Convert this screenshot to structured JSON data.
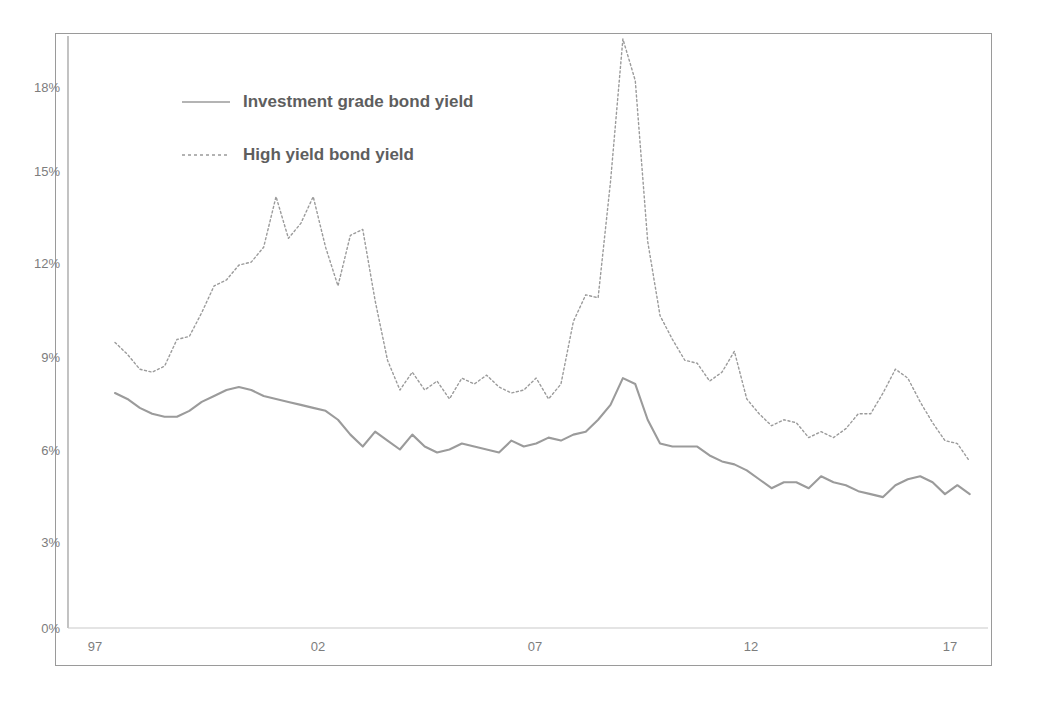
{
  "chart_data": {
    "type": "line",
    "title": "",
    "subtitle": "",
    "xlabel": "",
    "ylabel": "",
    "xlim": [
      1997.0,
      2017.9
    ],
    "ylim": [
      0,
      19.9
    ],
    "grid": false,
    "legend_position": "top-left-inside",
    "y_ticks": [
      "0%",
      "3%",
      "6%",
      "9%",
      "12%",
      "15%",
      "18%"
    ],
    "y_tick_values": [
      0,
      3,
      6,
      9,
      12,
      15,
      18
    ],
    "x_ticks": [
      "97",
      "02",
      "07",
      "12",
      "17"
    ],
    "x_tick_values": [
      1997,
      2002,
      2007,
      2012,
      2017
    ],
    "series": [
      {
        "name": "Investment grade bond yield",
        "style": "solid",
        "color": "#9b9b9b",
        "x": [
          1997.0,
          1997.3,
          1997.6,
          1997.9,
          1998.2,
          1998.5,
          1998.8,
          1999.1,
          1999.4,
          1999.7,
          2000.0,
          2000.3,
          2000.6,
          2000.9,
          2001.2,
          2001.5,
          2001.8,
          2002.1,
          2002.4,
          2002.7,
          2003.0,
          2003.3,
          2003.6,
          2003.9,
          2004.2,
          2004.5,
          2004.8,
          2005.1,
          2005.4,
          2005.7,
          2006.0,
          2006.3,
          2006.6,
          2006.9,
          2007.2,
          2007.5,
          2007.8,
          2008.1,
          2008.4,
          2008.7,
          2009.0,
          2009.3,
          2009.6,
          2009.9,
          2010.2,
          2010.5,
          2010.8,
          2011.1,
          2011.4,
          2011.7,
          2012.0,
          2012.3,
          2012.6,
          2012.9,
          2013.2,
          2013.5,
          2013.8,
          2014.1,
          2014.4,
          2014.7,
          2015.0,
          2015.3,
          2015.6,
          2015.9,
          2016.2,
          2016.5,
          2016.8,
          2017.1,
          2017.4,
          2017.7
        ],
        "y": [
          7.9,
          7.7,
          7.4,
          7.2,
          7.1,
          7.1,
          7.3,
          7.6,
          7.8,
          8.0,
          8.1,
          8.0,
          7.8,
          7.7,
          7.6,
          7.5,
          7.4,
          7.3,
          7.0,
          6.5,
          6.1,
          6.6,
          6.3,
          6.0,
          6.5,
          6.1,
          5.9,
          6.0,
          6.2,
          6.1,
          6.0,
          5.9,
          6.3,
          6.1,
          6.2,
          6.4,
          6.3,
          6.5,
          6.6,
          7.0,
          7.5,
          8.4,
          8.2,
          7.0,
          6.2,
          6.1,
          6.1,
          6.1,
          5.8,
          5.6,
          5.5,
          5.3,
          5.0,
          4.7,
          4.9,
          4.9,
          4.7,
          5.1,
          4.9,
          4.8,
          4.6,
          4.5,
          4.4,
          4.8,
          5.0,
          5.1,
          4.9,
          4.5,
          4.8,
          4.5
        ]
      },
      {
        "name": "High yield bond yield",
        "style": "dotted",
        "color": "#9b9b9b",
        "x": [
          1997.0,
          1997.3,
          1997.6,
          1997.9,
          1998.2,
          1998.5,
          1998.8,
          1999.1,
          1999.4,
          1999.7,
          2000.0,
          2000.3,
          2000.6,
          2000.9,
          2001.2,
          2001.5,
          2001.8,
          2002.1,
          2002.4,
          2002.7,
          2003.0,
          2003.3,
          2003.6,
          2003.9,
          2004.2,
          2004.5,
          2004.8,
          2005.1,
          2005.4,
          2005.7,
          2006.0,
          2006.3,
          2006.6,
          2006.9,
          2007.2,
          2007.5,
          2007.8,
          2008.1,
          2008.4,
          2008.7,
          2009.0,
          2009.3,
          2009.6,
          2009.9,
          2010.2,
          2010.5,
          2010.8,
          2011.1,
          2011.4,
          2011.7,
          2012.0,
          2012.3,
          2012.6,
          2012.9,
          2013.2,
          2013.5,
          2013.8,
          2014.1,
          2014.4,
          2014.7,
          2015.0,
          2015.3,
          2015.6,
          2015.9,
          2016.2,
          2016.5,
          2016.8,
          2017.1,
          2017.4,
          2017.7
        ],
        "y": [
          9.6,
          9.2,
          8.7,
          8.6,
          8.8,
          9.7,
          9.8,
          10.6,
          11.5,
          11.7,
          12.2,
          12.3,
          12.8,
          14.5,
          13.1,
          13.6,
          14.5,
          12.8,
          11.5,
          13.2,
          13.4,
          11.0,
          9.0,
          8.0,
          8.6,
          8.0,
          8.3,
          7.7,
          8.4,
          8.2,
          8.5,
          8.1,
          7.9,
          8.0,
          8.4,
          7.7,
          8.2,
          10.3,
          11.2,
          11.1,
          15.0,
          19.8,
          18.4,
          13.0,
          10.5,
          9.7,
          9.0,
          8.9,
          8.3,
          8.6,
          9.3,
          7.7,
          7.2,
          6.8,
          7.0,
          6.9,
          6.4,
          6.6,
          6.4,
          6.7,
          7.2,
          7.2,
          7.9,
          8.7,
          8.4,
          7.6,
          6.9,
          6.3,
          6.2,
          5.6
        ]
      }
    ]
  },
  "axes": {
    "y_labels": [
      {
        "text": "18%",
        "value": 18
      },
      {
        "text": "15%",
        "value": 15
      },
      {
        "text": "12%",
        "value": 12
      },
      {
        "text": "9%",
        "value": 9
      },
      {
        "text": "6%",
        "value": 6
      },
      {
        "text": "3%",
        "value": 3
      },
      {
        "text": "0%",
        "value": 0
      }
    ],
    "x_labels": [
      {
        "text": "97",
        "value": 1997
      },
      {
        "text": "02",
        "value": 2002
      },
      {
        "text": "07",
        "value": 2007
      },
      {
        "text": "12",
        "value": 2012
      },
      {
        "text": "17",
        "value": 2017
      }
    ]
  },
  "legend": {
    "entries": [
      {
        "label": "Investment grade bond yield",
        "style": "solid"
      },
      {
        "label": "High yield bond yield",
        "style": "dotted"
      }
    ]
  },
  "colors": {
    "line": "#9b9b9b",
    "axis": "#9a9a9a",
    "tick_text": "#7d7d7d",
    "legend_text": "#5e5e5e",
    "background": "#ffffff"
  }
}
